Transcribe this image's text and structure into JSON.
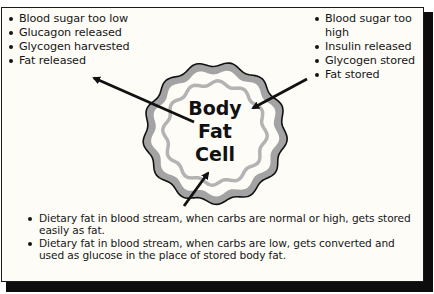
{
  "diagram": {
    "cell_label_lines": [
      "Body",
      "Fat",
      "Cell"
    ],
    "left_list": {
      "items": [
        "Blood sugar too low",
        "Glucagon released",
        "Glycogen harvested",
        "Fat released"
      ],
      "arrow_direction": "out-of-cell"
    },
    "right_list": {
      "items": [
        "Blood sugar too high",
        "Insulin released",
        "Glycogen stored",
        "Fat stored"
      ],
      "arrow_direction": "into-cell"
    },
    "bottom_list": {
      "items": [
        "Dietary fat in blood stream, when carbs are normal or high, gets stored easily as fat.",
        "Dietary fat in blood stream, when carbs are low, gets converted and used as glucose in the place of stored body fat."
      ],
      "arrow_direction": "into-cell"
    },
    "colors": {
      "outer_ring": "#a3a3a3",
      "inner_ring": "#b3b3b3",
      "outline": "#111111",
      "background": "#fdfcf7",
      "shadow": "#0d0d0d"
    }
  }
}
